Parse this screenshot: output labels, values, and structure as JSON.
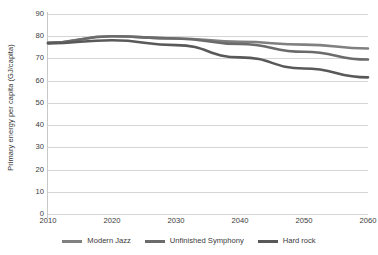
{
  "chart_data": {
    "type": "line",
    "title": "",
    "xlabel": "",
    "ylabel": "Primary energy per capita (GJ/capita)",
    "categories": [
      2010,
      2020,
      2030,
      2040,
      2050,
      2060
    ],
    "x_tick_labels": [
      "2010",
      "2020",
      "2030",
      "2040",
      "2050",
      "2060"
    ],
    "y_tick_labels": [
      "90",
      "80",
      "70",
      "60",
      "50",
      "40",
      "30",
      "20",
      "10",
      "0"
    ],
    "y_ticks": [
      90,
      80,
      70,
      60,
      50,
      40,
      30,
      20,
      10,
      0
    ],
    "ylim": [
      0,
      90
    ],
    "xlim": [
      2010,
      2060
    ],
    "grid": "horizontal",
    "legend_position": "bottom",
    "series": [
      {
        "name": "Modern Jazz",
        "color": "#808080",
        "values": [
          77.0,
          80.0,
          79.0,
          77.5,
          76.2,
          74.5
        ]
      },
      {
        "name": "Unfinished Symphony",
        "color": "#6b6b6b",
        "values": [
          77.0,
          80.0,
          79.0,
          76.5,
          73.0,
          69.5
        ]
      },
      {
        "name": "Hard rock",
        "color": "#595959",
        "values": [
          76.8,
          78.2,
          76.0,
          70.5,
          65.5,
          61.5
        ]
      }
    ]
  },
  "colors": {
    "gridline": "#d5d5d5",
    "axis": "#c9c9c9",
    "text": "#3a3a3a",
    "background": "#ffffff"
  }
}
